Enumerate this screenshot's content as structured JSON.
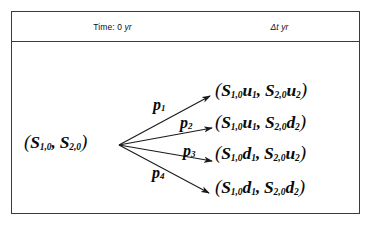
{
  "figure": {
    "name": "two-asset-one-period-binomial-tree",
    "frame": {
      "border_color": "#3a3a3a",
      "background": "#ffffff"
    }
  },
  "header": {
    "left": {
      "prefix": "Time: 0",
      "unit": "yr"
    },
    "right": {
      "prefix": "Δt",
      "unit": "yr"
    }
  },
  "tree": {
    "root": {
      "open_paren": "(",
      "s1": "S",
      "s1_sub": "1,0",
      "comma": ", ",
      "s2": "S",
      "s2_sub": "2,0",
      "close_paren": ")"
    },
    "branches": [
      {
        "id": "branch-1",
        "probability_label": "p",
        "probability_sub": "1",
        "outcome": {
          "open_paren": "(",
          "s1": "S",
          "s1_sub": "1,0",
          "move1": "u",
          "move1_sub": "1",
          "comma": ", ",
          "s2": "S",
          "s2_sub": "2,0",
          "move2": "u",
          "move2_sub": "2",
          "close_paren": ")"
        }
      },
      {
        "id": "branch-2",
        "probability_label": "p",
        "probability_sub": "2",
        "outcome": {
          "open_paren": "(",
          "s1": "S",
          "s1_sub": "1,0",
          "move1": "u",
          "move1_sub": "1",
          "comma": ", ",
          "s2": "S",
          "s2_sub": "2,0",
          "move2": "d",
          "move2_sub": "2",
          "close_paren": ")"
        }
      },
      {
        "id": "branch-3",
        "probability_label": "p",
        "probability_sub": "3",
        "outcome": {
          "open_paren": "(",
          "s1": "S",
          "s1_sub": "1,0",
          "move1": "d",
          "move1_sub": "1",
          "comma": ", ",
          "s2": "S",
          "s2_sub": "2,0",
          "move2": "u",
          "move2_sub": "2",
          "close_paren": ")"
        }
      },
      {
        "id": "branch-4",
        "probability_label": "p",
        "probability_sub": "4",
        "outcome": {
          "open_paren": "(",
          "s1": "S",
          "s1_sub": "1,0",
          "move1": "d",
          "move1_sub": "1",
          "comma": ", ",
          "s2": "S",
          "s2_sub": "2,0",
          "move2": "d",
          "move2_sub": "2",
          "close_paren": ")"
        }
      }
    ]
  }
}
